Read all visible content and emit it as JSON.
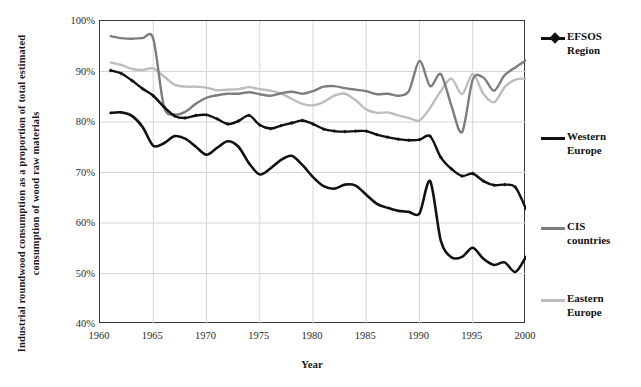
{
  "chart_data": {
    "type": "line",
    "title": "",
    "xlabel": "Year",
    "ylabel": "Industrial roundwood consumption as a proportion of total estimated consumption of wood raw materials",
    "xlim": [
      1960,
      2000
    ],
    "ylim": [
      40,
      100
    ],
    "ytick_labels": [
      "100%",
      "90%",
      "80%",
      "70%",
      "60%",
      "50%",
      "40%"
    ],
    "ytick_values": [
      100,
      90,
      80,
      70,
      60,
      50,
      40
    ],
    "xtick_labels": [
      "1960",
      "1965",
      "1970",
      "1975",
      "1980",
      "1985",
      "1990",
      "1995",
      "2000"
    ],
    "xtick_values": [
      1960,
      1965,
      1970,
      1975,
      1980,
      1985,
      1990,
      1995,
      2000
    ],
    "grid": true,
    "legend_position": "right-outside",
    "x": [
      1961,
      1962,
      1963,
      1964,
      1965,
      1966,
      1967,
      1968,
      1969,
      1970,
      1971,
      1972,
      1973,
      1974,
      1975,
      1976,
      1977,
      1978,
      1979,
      1980,
      1981,
      1982,
      1983,
      1984,
      1985,
      1986,
      1987,
      1988,
      1989,
      1990,
      1991,
      1992,
      1993,
      1994,
      1995,
      1996,
      1997,
      1998,
      1999,
      2000
    ],
    "series": [
      {
        "name": "EFSOS Region",
        "color": "#111111",
        "width": 2.4,
        "marker": "diamond",
        "values": [
          90.2,
          89.6,
          88.2,
          86.6,
          85.2,
          83.0,
          81.2,
          80.8,
          81.3,
          81.4,
          80.6,
          79.6,
          80.2,
          81.3,
          79.4,
          78.7,
          79.3,
          79.8,
          80.3,
          79.6,
          78.6,
          78.2,
          78.1,
          78.2,
          78.2,
          77.5,
          77.0,
          76.6,
          76.4,
          76.5,
          77.2,
          73.0,
          70.7,
          69.3,
          69.8,
          68.3,
          67.5,
          67.6,
          67.1,
          62.8
        ]
      },
      {
        "name": "Western Europe",
        "color": "#111111",
        "width": 2.6,
        "marker": "none",
        "values": [
          81.8,
          81.9,
          81.2,
          79.0,
          75.3,
          75.8,
          77.2,
          76.7,
          75.1,
          73.5,
          74.9,
          76.2,
          75.1,
          71.8,
          69.6,
          70.8,
          72.5,
          73.3,
          71.5,
          69.1,
          67.3,
          66.8,
          67.6,
          67.4,
          65.6,
          63.8,
          63.0,
          62.4,
          62.2,
          61.9,
          68.3,
          56.5,
          53.2,
          53.3,
          55.1,
          52.9,
          51.7,
          52.2,
          50.3,
          53.3
        ]
      },
      {
        "name": "CIS countries",
        "color": "#7d7d7d",
        "width": 2.4,
        "marker": "none",
        "values": [
          97.0,
          96.6,
          96.5,
          96.6,
          96.5,
          83.1,
          81.5,
          82.0,
          83.6,
          84.8,
          85.3,
          85.6,
          85.6,
          85.9,
          85.5,
          85.2,
          85.7,
          86.0,
          85.6,
          86.1,
          87.0,
          87.1,
          86.7,
          86.4,
          86.1,
          85.5,
          85.6,
          85.2,
          86.1,
          92.1,
          87.1,
          89.5,
          83.2,
          78.0,
          88.4,
          88.8,
          86.2,
          89.3,
          90.8,
          92.2
        ]
      },
      {
        "name": "Eastern Europe",
        "color": "#bdbdbd",
        "width": 2.4,
        "marker": "none",
        "values": [
          91.8,
          91.3,
          90.5,
          90.3,
          90.6,
          89.0,
          87.4,
          87.0,
          87.0,
          86.8,
          86.3,
          86.4,
          86.5,
          86.9,
          86.5,
          86.2,
          85.6,
          84.6,
          83.6,
          83.3,
          84.0,
          85.2,
          85.6,
          84.3,
          82.5,
          81.8,
          81.9,
          81.3,
          80.8,
          80.3,
          82.8,
          86.1,
          88.6,
          85.5,
          89.5,
          85.6,
          83.9,
          86.9,
          88.4,
          88.6
        ]
      }
    ]
  },
  "legend": {
    "items": [
      {
        "label_line1": "EFSOS",
        "label_line2": "Region"
      },
      {
        "label_line1": "Western",
        "label_line2": "Europe"
      },
      {
        "label_line1": "CIS",
        "label_line2": "countries"
      },
      {
        "label_line1": "Eastern",
        "label_line2": "Europe"
      }
    ]
  }
}
